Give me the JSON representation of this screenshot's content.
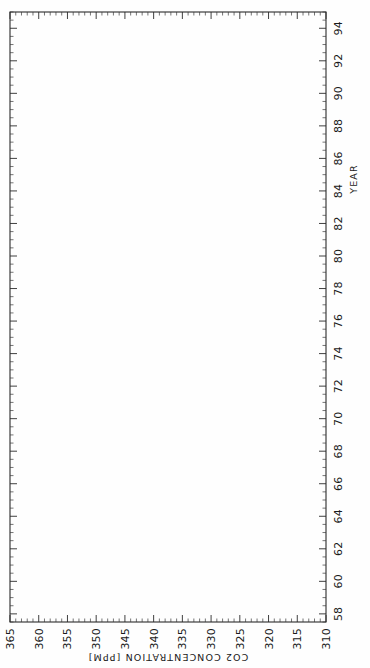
{
  "figure": {
    "orientation": "rotated-90-ccw",
    "background_color": "#fefefe",
    "frame_color": "#2a2a2a",
    "data_color": "#1b1b1b"
  },
  "chart_data": {
    "type": "line",
    "title": "",
    "subtitle": "",
    "xlabel": "YEAR",
    "ylabel": "CO2 CONCENTRATION [PPM]",
    "xlim": [
      57.5,
      95.0
    ],
    "ylim": [
      310,
      365
    ],
    "xticks": [
      58,
      60,
      62,
      64,
      66,
      68,
      70,
      72,
      74,
      76,
      78,
      80,
      82,
      84,
      86,
      88,
      90,
      92,
      94
    ],
    "xticklabels": [
      "58",
      "60",
      "62",
      "64",
      "66",
      "68",
      "70",
      "72",
      "74",
      "76",
      "78",
      "80",
      "82",
      "84",
      "86",
      "88",
      "90",
      "92",
      "94"
    ],
    "x_minor_step": 0.5,
    "yticks": [
      310,
      315,
      320,
      325,
      330,
      335,
      340,
      345,
      350,
      355,
      360,
      365
    ],
    "yticklabels": [
      "310",
      "315",
      "320",
      "325",
      "330",
      "335",
      "340",
      "345",
      "350",
      "355",
      "360",
      "365"
    ],
    "y_minor_step": 1,
    "grid": false,
    "legend": null,
    "markers": "dots",
    "series": [
      {
        "name": "Mauna Loa monthly mean CO2",
        "x_start_year": 1958.2,
        "x_step_years": 0.0833333,
        "annual_means": [
          {
            "year": 58,
            "value": 315.0
          },
          {
            "year": 59,
            "value": 315.9
          },
          {
            "year": 60,
            "value": 316.9
          },
          {
            "year": 61,
            "value": 317.6
          },
          {
            "year": 62,
            "value": 318.4
          },
          {
            "year": 63,
            "value": 319.0
          },
          {
            "year": 64,
            "value": 319.6
          },
          {
            "year": 65,
            "value": 320.0
          },
          {
            "year": 66,
            "value": 321.3
          },
          {
            "year": 67,
            "value": 322.1
          },
          {
            "year": 68,
            "value": 323.0
          },
          {
            "year": 69,
            "value": 324.6
          },
          {
            "year": 70,
            "value": 325.6
          },
          {
            "year": 71,
            "value": 326.3
          },
          {
            "year": 72,
            "value": 327.4
          },
          {
            "year": 73,
            "value": 329.6
          },
          {
            "year": 74,
            "value": 330.2
          },
          {
            "year": 75,
            "value": 331.1
          },
          {
            "year": 76,
            "value": 332.0
          },
          {
            "year": 77,
            "value": 333.8
          },
          {
            "year": 78,
            "value": 335.4
          },
          {
            "year": 79,
            "value": 336.8
          },
          {
            "year": 80,
            "value": 338.7
          },
          {
            "year": 81,
            "value": 340.1
          },
          {
            "year": 82,
            "value": 341.4
          },
          {
            "year": 83,
            "value": 343.0
          },
          {
            "year": 84,
            "value": 344.6
          },
          {
            "year": 85,
            "value": 346.0
          },
          {
            "year": 86,
            "value": 347.4
          },
          {
            "year": 87,
            "value": 349.2
          },
          {
            "year": 88,
            "value": 351.6
          },
          {
            "year": 89,
            "value": 353.1
          },
          {
            "year": 90,
            "value": 354.4
          },
          {
            "year": 91,
            "value": 355.6
          },
          {
            "year": 92,
            "value": 356.4
          },
          {
            "year": 93,
            "value": 357.1
          },
          {
            "year": 94,
            "value": 358.8
          },
          {
            "year": 95,
            "value": 360.7
          }
        ],
        "seasonal_amplitude_ppm": 3.1,
        "seasonal_peak_month": 5,
        "description": "Monthly mean atmospheric CO2 concentration at Mauna Loa Observatory showing rising trend with annual seasonal oscillation"
      }
    ]
  }
}
